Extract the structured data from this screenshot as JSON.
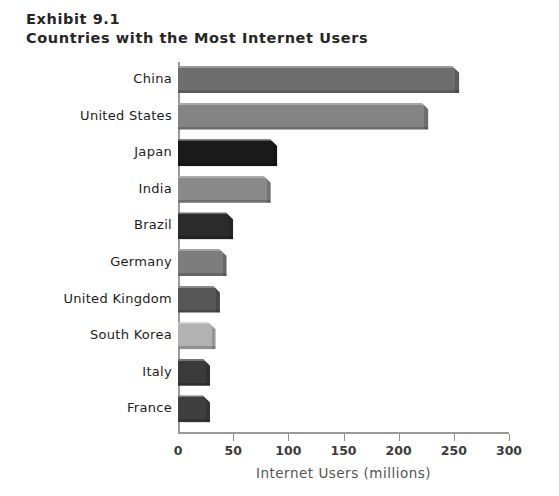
{
  "chart_data": {
    "type": "bar",
    "orientation": "horizontal",
    "title": "Countries with the Most Internet Users",
    "exhibit_label": "Exhibit 9.1",
    "categories": [
      "China",
      "United States",
      "Japan",
      "India",
      "Brazil",
      "Germany",
      "United Kingdom",
      "South Korea",
      "Italy",
      "France"
    ],
    "values": [
      255,
      227,
      90,
      84,
      50,
      44,
      38,
      34,
      29,
      29
    ],
    "bar_colors": [
      "#6e6e6e",
      "#848484",
      "#1a1a1a",
      "#8a8a8a",
      "#2b2b2b",
      "#7d7d7d",
      "#565656",
      "#b2b2b2",
      "#3a3a3a",
      "#3f3f3f"
    ],
    "xlabel": "Internet Users (millions)",
    "ylabel": "",
    "xlim": [
      0,
      300
    ],
    "xticks": [
      0,
      50,
      100,
      150,
      200,
      250,
      300
    ],
    "xtick_labels": [
      "0",
      "50",
      "100",
      "150",
      "200",
      "250",
      "300"
    ],
    "grid": false,
    "legend": false,
    "axis_color": "#9a9a9a",
    "background": "#ffffff"
  }
}
